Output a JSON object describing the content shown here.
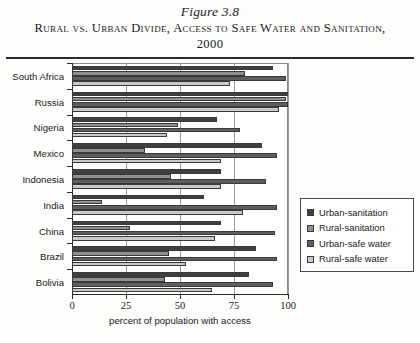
{
  "figure": {
    "number": "Figure 3.8",
    "title": "Rural vs. Urban Divide, Access to Safe Water and Sanitation, 2000"
  },
  "chart_data": {
    "type": "bar",
    "orientation": "horizontal",
    "title": "Rural vs. Urban Divide, Access to Safe Water and Sanitation, 2000",
    "xlabel": "percent of population with access",
    "ylabel": "",
    "xlim": [
      0,
      100
    ],
    "xticks": [
      0,
      25,
      50,
      75,
      100
    ],
    "grid": true,
    "legend_position": "right",
    "categories": [
      "South Africa",
      "Russia",
      "Nigeria",
      "Mexico",
      "Indonesia",
      "India",
      "China",
      "Brazil",
      "Bolivia"
    ],
    "series": [
      {
        "name": "Urban-sanitation",
        "color": "#3f3f3f",
        "values": [
          93,
          100,
          67,
          88,
          69,
          61,
          69,
          85,
          82
        ]
      },
      {
        "name": "Rural-sanitation",
        "color": "#8f8f8f",
        "values": [
          80,
          99,
          49,
          34,
          46,
          14,
          27,
          45,
          43
        ]
      },
      {
        "name": "Urban-safe water",
        "color": "#5e5e5e",
        "values": [
          99,
          100,
          78,
          95,
          90,
          95,
          94,
          95,
          93
        ]
      },
      {
        "name": "Rural-safe water",
        "color": "#c9c9c9",
        "values": [
          73,
          96,
          44,
          69,
          69,
          79,
          66,
          53,
          65
        ]
      }
    ]
  },
  "legend": {
    "items": [
      {
        "label": "Urban-sanitation",
        "color": "#3f3f3f"
      },
      {
        "label": "Rural-sanitation",
        "color": "#8f8f8f"
      },
      {
        "label": "Urban-safe water",
        "color": "#5e5e5e"
      },
      {
        "label": "Rural-safe water",
        "color": "#c9c9c9"
      }
    ]
  }
}
